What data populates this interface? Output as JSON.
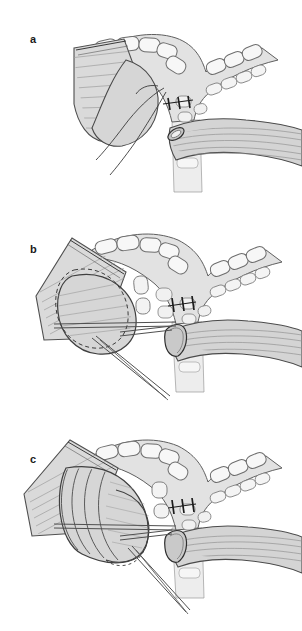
{
  "figure": {
    "type": "surgical-illustration",
    "background_color": "#ffffff",
    "width": 302,
    "height": 631,
    "panel_count": 3
  },
  "panels": [
    {
      "id": "a",
      "label": "a",
      "label_x": 30,
      "label_y": 34,
      "caption_text": "a",
      "stage": "Sutures placed at anastomosis, suture tails hanging free",
      "features": [
        "tracheal-cartilage-rings",
        "carina-bifurcation",
        "left-main-bronchus-stump",
        "right-main-bronchus-muscle-tube",
        "suture-row",
        "free-suture-tails"
      ]
    },
    {
      "id": "b",
      "label": "b",
      "label_x": 30,
      "label_y": 244,
      "caption_text": "b",
      "stage": "Bronchial stump advanced; dashed line marks original position; forceps in place",
      "features": [
        "tracheal-cartilage-rings",
        "carina-bifurcation",
        "advanced-bronchial-stump",
        "dashed-original-outline",
        "surgical-forceps",
        "retractor-shaft",
        "suture-row"
      ]
    },
    {
      "id": "c",
      "label": "c",
      "label_x": 30,
      "label_y": 454,
      "caption_text": "c",
      "stage": "Bronchus fully telescoped with concentric cartilage rings visible",
      "features": [
        "tracheal-cartilage-rings",
        "carina-bifurcation",
        "telescoped-bronchus-rings",
        "surgical-forceps",
        "retractor-shaft",
        "suture-row"
      ]
    }
  ],
  "colors": {
    "outline": "#4a4a4a",
    "outline_dark": "#2b2b2b",
    "tissue_fill": "#d8d8d8",
    "tissue_fill_light": "#e8e8e8",
    "cartilage_fill": "#f2f2f2",
    "cartilage_outline": "#6a6a6a",
    "striation": "#9a9a9a",
    "suture": "#1c1c1c",
    "instrument": "#5a5a5a",
    "background": "#ffffff",
    "label": "#1a1a1a"
  },
  "anatomy_labels": {
    "trachea": "trachea",
    "carina": "carina",
    "left_main_bronchus": "left main bronchus",
    "right_main_bronchus": "right main bronchus",
    "cartilage_ring": "cartilage ring",
    "suture": "suture",
    "forceps": "forceps",
    "retractor": "retractor"
  }
}
